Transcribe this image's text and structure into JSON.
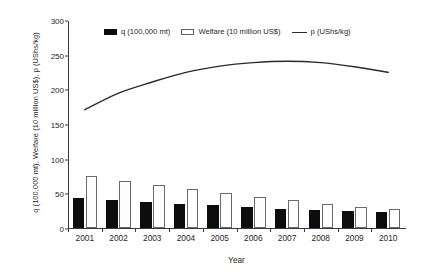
{
  "chart_data": {
    "type": "bar",
    "title": "",
    "xlabel": "Year",
    "ylabel": "q (100,000 mt), Welfare (10 million US$), p (UShs/kg)",
    "categories": [
      "2001",
      "2002",
      "2003",
      "2004",
      "2005",
      "2006",
      "2007",
      "2008",
      "2009",
      "2010"
    ],
    "ylim": [
      0,
      300
    ],
    "yticks": [
      0,
      50,
      100,
      150,
      200,
      250,
      300
    ],
    "grid": false,
    "legend_position": "top-center",
    "series": [
      {
        "name": "q (100,000 mt)",
        "marker": "filled-black-bar",
        "color": "#0d0d0d",
        "type": "bar",
        "values": [
          44,
          41,
          38,
          35,
          33,
          30,
          28,
          26,
          24,
          23
        ]
      },
      {
        "name": "Welfare (10 million US$)",
        "marker": "open-white-bar",
        "color": "#ffffff",
        "type": "bar",
        "values": [
          75,
          68,
          62,
          56,
          51,
          45,
          40,
          35,
          31,
          27
        ]
      },
      {
        "name": "p (UShs/kg)",
        "marker": "solid-line",
        "color": "#2b2b2b",
        "type": "line",
        "values": [
          172,
          196,
          212,
          226,
          235,
          240,
          242,
          240,
          234,
          226
        ]
      }
    ]
  },
  "legend": {
    "items": [
      {
        "label": "q (100,000 mt)"
      },
      {
        "label": "Welfare (10 million US$)"
      },
      {
        "label": "p (UShs/kg)"
      }
    ]
  },
  "axes": {
    "y_title": "q (100,000 mt), Welfare (10 million US$), p (UShs/kg)",
    "x_title": "Year",
    "y_tick_labels": [
      "0",
      "50",
      "100",
      "150",
      "200",
      "250",
      "300"
    ],
    "x_tick_labels": [
      "2001",
      "2002",
      "2003",
      "2004",
      "2005",
      "2006",
      "2007",
      "2008",
      "2009",
      "2010"
    ]
  },
  "colors": {
    "q_bar": "#0d0d0d",
    "welfare_bar": "#ffffff",
    "welfare_bar_border": "#6b6b6b",
    "p_line": "#2b2b2b",
    "axis": "#3a3a3a",
    "background": "#ffffff"
  }
}
